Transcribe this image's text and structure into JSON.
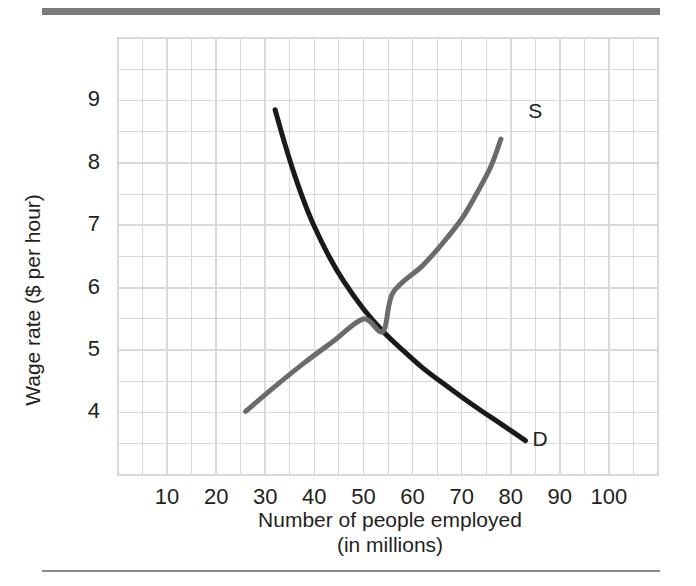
{
  "figure": {
    "top_rule_color": "#7a7a7a",
    "bottom_rule_color": "#8a8a8a",
    "background": "#ffffff"
  },
  "chart_data": {
    "type": "line",
    "title": "",
    "xlabel_line1": "Number of people employed",
    "xlabel_line2": "(in millions)",
    "ylabel": "Wage rate ($ per hour)",
    "xlim": [
      0,
      110
    ],
    "ylim": [
      3,
      10
    ],
    "xticks": [
      10,
      20,
      30,
      40,
      50,
      60,
      70,
      80,
      90,
      100
    ],
    "yticks": [
      4,
      5,
      6,
      7,
      8,
      9
    ],
    "xtick_labels": [
      "10",
      "20",
      "30",
      "40",
      "50",
      "60",
      "70",
      "80",
      "90",
      "100"
    ],
    "ytick_labels": [
      "4",
      "5",
      "6",
      "7",
      "8",
      "9"
    ],
    "grid": true,
    "grid_color": "#d9d9d9",
    "grid_minor_step_x": 5,
    "grid_minor_step_y": 0.5,
    "legend": "none",
    "series": [
      {
        "name": "Demand",
        "label": "D",
        "color": "#1a1a1a",
        "line_width": 5,
        "label_x": 86,
        "label_y": 3.55,
        "points": [
          {
            "x": 32.0,
            "y": 8.85
          },
          {
            "x": 34.0,
            "y": 8.3
          },
          {
            "x": 36.0,
            "y": 7.8
          },
          {
            "x": 38.0,
            "y": 7.36
          },
          {
            "x": 40.0,
            "y": 6.98
          },
          {
            "x": 43.0,
            "y": 6.5
          },
          {
            "x": 46.0,
            "y": 6.1
          },
          {
            "x": 50.0,
            "y": 5.66
          },
          {
            "x": 54.0,
            "y": 5.3
          },
          {
            "x": 58.0,
            "y": 5.0
          },
          {
            "x": 62.0,
            "y": 4.72
          },
          {
            "x": 66.0,
            "y": 4.48
          },
          {
            "x": 70.0,
            "y": 4.25
          },
          {
            "x": 74.0,
            "y": 4.03
          },
          {
            "x": 78.0,
            "y": 3.82
          },
          {
            "x": 83.0,
            "y": 3.55
          }
        ]
      },
      {
        "name": "Supply",
        "label": "S",
        "color": "#6b6b6b",
        "line_width": 5,
        "label_x": 85,
        "label_y": 8.8,
        "points": [
          {
            "x": 26.0,
            "y": 4.02
          },
          {
            "x": 32.0,
            "y": 4.42
          },
          {
            "x": 38.0,
            "y": 4.8
          },
          {
            "x": 44.0,
            "y": 5.15
          },
          {
            "x": 50.0,
            "y": 5.5
          },
          {
            "x": 54.0,
            "y": 5.3
          },
          {
            "x": 56.0,
            "y": 5.92
          },
          {
            "x": 62.0,
            "y": 6.35
          },
          {
            "x": 66.0,
            "y": 6.7
          },
          {
            "x": 70.0,
            "y": 7.1
          },
          {
            "x": 73.0,
            "y": 7.5
          },
          {
            "x": 76.0,
            "y": 7.95
          },
          {
            "x": 78.0,
            "y": 8.38
          }
        ]
      }
    ],
    "annotations": [
      {
        "name": "supply-label",
        "text": "S"
      },
      {
        "name": "demand-label",
        "text": "D"
      }
    ]
  }
}
